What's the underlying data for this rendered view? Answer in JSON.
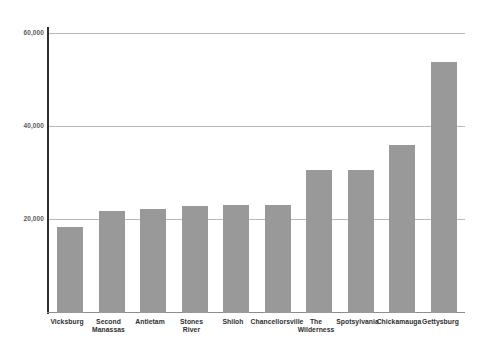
{
  "chart_data": {
    "type": "bar",
    "title": "",
    "subtitle": "",
    "xlabel": "",
    "ylabel": "",
    "categories": [
      "Vicksburg",
      "Second Manassas",
      "Antietam",
      "Stones River",
      "Shiloh",
      "Chancellorsville",
      "The Wilderness",
      "Spotsylvania",
      "Chickamauga",
      "Gettysburg"
    ],
    "category_lines": [
      [
        "Vicksburg"
      ],
      [
        "Second",
        "Manassas"
      ],
      [
        "Antietam"
      ],
      [
        "Stones",
        "River"
      ],
      [
        "Shiloh"
      ],
      [
        "Chancellorsville"
      ],
      [
        "The",
        "Wilderness"
      ],
      [
        "Spotsylvania"
      ],
      [
        "Chickamauga"
      ],
      [
        "Gettysburg"
      ]
    ],
    "values": [
      18700,
      22300,
      22800,
      23300,
      23600,
      23600,
      31200,
      31200,
      36800,
      54800
    ],
    "ylim": [
      0,
      64000
    ],
    "yticks": [
      20000,
      40000,
      60000
    ],
    "ytick_labels": [
      "20,000",
      "40,000",
      "60,000"
    ],
    "grid": true,
    "gridlines": "horizontal",
    "legend": "none",
    "bar_color": "#999999",
    "gridline_color": "#b9b9b9",
    "axis_color": "#2e2e2e",
    "background_color": "#ffffff",
    "label_color": "#2f2f2f"
  }
}
